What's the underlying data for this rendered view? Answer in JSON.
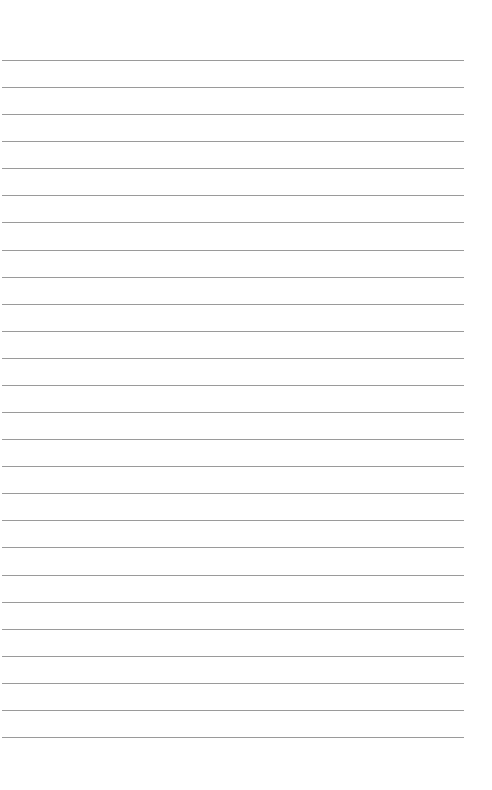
{
  "page": {
    "type": "lined-paper",
    "background_color": "#ffffff",
    "line_color": "#9a9a9a",
    "line_count": 26,
    "first_line_y": 60,
    "line_spacing": 27.08,
    "line_left": 2,
    "line_width": 462
  }
}
